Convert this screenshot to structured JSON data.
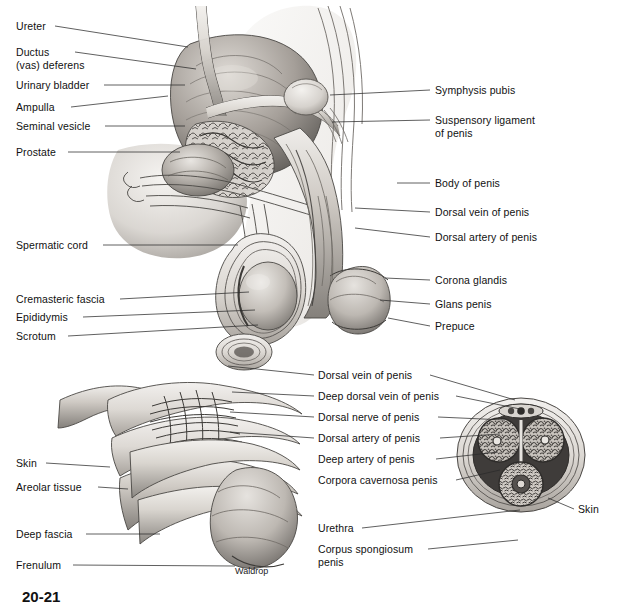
{
  "figure": {
    "artist_signature": "Waldrop",
    "figure_number": "20-21",
    "style": "grayscale airbrush medical illustration",
    "background_color": "#ffffff",
    "line_color": "#111111"
  },
  "upper_panel": {
    "name": "sagittal-section-male-pelvis",
    "left_labels": [
      {
        "id": "ureter",
        "text": "Ureter",
        "x": 16,
        "y": 20,
        "leader": [
          [
            55,
            26
          ],
          [
            188,
            47
          ]
        ]
      },
      {
        "id": "ductus-vas-deferens",
        "text": "Ductus\n(vas) deferens",
        "x": 16,
        "y": 46,
        "leader": [
          [
            75,
            52
          ],
          [
            196,
            69
          ]
        ]
      },
      {
        "id": "urinary-bladder",
        "text": "Urinary bladder",
        "x": 16,
        "y": 79,
        "leader": [
          [
            104,
            85
          ],
          [
            185,
            85
          ]
        ]
      },
      {
        "id": "ampulla",
        "text": "Ampulla",
        "x": 16,
        "y": 101,
        "leader": [
          [
            71,
            107
          ],
          [
            168,
            96
          ]
        ]
      },
      {
        "id": "seminal-vesicle",
        "text": "Seminal vesicle",
        "x": 16,
        "y": 120,
        "leader": [
          [
            105,
            126
          ],
          [
            185,
            126
          ]
        ]
      },
      {
        "id": "prostate",
        "text": "Prostate",
        "x": 16,
        "y": 146,
        "leader": [
          [
            68,
            152
          ],
          [
            180,
            152
          ]
        ]
      },
      {
        "id": "spermatic-cord",
        "text": "Spermatic cord",
        "x": 16,
        "y": 239,
        "leader": [
          [
            103,
            245
          ],
          [
            238,
            245
          ]
        ]
      },
      {
        "id": "cremasteric-fascia",
        "text": "Cremasteric fascia",
        "x": 16,
        "y": 293,
        "leader": [
          [
            120,
            299
          ],
          [
            249,
            292
          ]
        ]
      },
      {
        "id": "epididymis",
        "text": "Epididymis",
        "x": 16,
        "y": 311,
        "leader": [
          [
            83,
            317
          ],
          [
            255,
            310
          ]
        ]
      },
      {
        "id": "scrotum",
        "text": "Scrotum",
        "x": 16,
        "y": 330,
        "leader": [
          [
            68,
            336
          ],
          [
            258,
            325
          ]
        ]
      }
    ],
    "right_labels": [
      {
        "id": "symphysis-pubis",
        "text": "Symphysis pubis",
        "x": 435,
        "y": 84,
        "leader": [
          [
            430,
            90
          ],
          [
            330,
            95
          ]
        ]
      },
      {
        "id": "suspensory-ligament-of-penis",
        "text": "Suspensory ligament\nof penis",
        "x": 435,
        "y": 114,
        "leader": [
          [
            430,
            120
          ],
          [
            332,
            122
          ]
        ]
      },
      {
        "id": "body-of-penis",
        "text": "Body of penis",
        "x": 435,
        "y": 177,
        "leader": [
          [
            430,
            183
          ],
          [
            397,
            183
          ]
        ]
      },
      {
        "id": "dorsal-vein-of-penis",
        "text": "Dorsal vein of penis",
        "x": 435,
        "y": 206,
        "leader": [
          [
            430,
            212
          ],
          [
            355,
            208
          ]
        ]
      },
      {
        "id": "dorsal-artery-of-penis",
        "text": "Dorsal artery of penis",
        "x": 435,
        "y": 231,
        "leader": [
          [
            430,
            237
          ],
          [
            355,
            228
          ]
        ]
      },
      {
        "id": "corona-glandis",
        "text": "Corona glandis",
        "x": 435,
        "y": 274,
        "leader": [
          [
            430,
            280
          ],
          [
            385,
            278
          ]
        ]
      },
      {
        "id": "glans-penis",
        "text": "Glans penis",
        "x": 435,
        "y": 298,
        "leader": [
          [
            430,
            304
          ],
          [
            380,
            300
          ]
        ]
      },
      {
        "id": "prepuce",
        "text": "Prepuce",
        "x": 435,
        "y": 320,
        "leader": [
          [
            430,
            326
          ],
          [
            388,
            318
          ]
        ]
      }
    ]
  },
  "lower_left_panel": {
    "name": "penis-dissection-superficial-layers",
    "labels": [
      {
        "id": "skin",
        "text": "Skin",
        "x": 16,
        "y": 457,
        "leader": [
          [
            46,
            463
          ],
          [
            110,
            467
          ]
        ]
      },
      {
        "id": "areolar-tissue",
        "text": "Areolar tissue",
        "x": 16,
        "y": 481,
        "leader": [
          [
            98,
            487
          ],
          [
            128,
            489
          ]
        ]
      },
      {
        "id": "deep-fascia",
        "text": "Deep fascia",
        "x": 16,
        "y": 528,
        "leader": [
          [
            86,
            534
          ],
          [
            160,
            534
          ]
        ]
      },
      {
        "id": "frenulum",
        "text": "Frenulum",
        "x": 16,
        "y": 559,
        "leader": [
          [
            73,
            565
          ],
          [
            235,
            566
          ]
        ]
      }
    ]
  },
  "center_labels": {
    "name": "shared-structure-labels",
    "items": [
      {
        "id": "dorsal-vein-of-penis-2",
        "text": "Dorsal vein of penis",
        "x": 318,
        "y": 369,
        "leader_left": [
          [
            314,
            375
          ],
          [
            228,
            366
          ]
        ],
        "leader_right": [
          [
            430,
            375
          ],
          [
            515,
            400
          ]
        ]
      },
      {
        "id": "deep-dorsal-vein-of-penis",
        "text": "Deep dorsal vein of penis",
        "x": 318,
        "y": 390,
        "leader_left": [
          [
            314,
            396
          ],
          [
            232,
            392
          ]
        ],
        "leader_right": [
          [
            456,
            396
          ],
          [
            520,
            409
          ]
        ]
      },
      {
        "id": "dorsal-nerve-of-penis",
        "text": "Dorsal nerve of penis",
        "x": 318,
        "y": 411,
        "leader_left": [
          [
            314,
            417
          ],
          [
            230,
            412
          ]
        ],
        "leader_right": [
          [
            438,
            417
          ],
          [
            505,
            420
          ]
        ]
      },
      {
        "id": "dorsal-artery-of-penis-2",
        "text": "Dorsal artery of penis",
        "x": 318,
        "y": 432,
        "leader_left": [
          [
            314,
            438
          ],
          [
            230,
            432
          ]
        ],
        "leader_right": [
          [
            440,
            438
          ],
          [
            500,
            434
          ]
        ]
      },
      {
        "id": "deep-artery-of-penis",
        "text": "Deep artery of penis",
        "x": 318,
        "y": 453,
        "leader_right": [
          [
            436,
            459
          ],
          [
            498,
            452
          ]
        ]
      },
      {
        "id": "corpora-cavernosa-penis",
        "text": "Corpora cavernosa penis",
        "x": 318,
        "y": 474,
        "leader_right": [
          [
            456,
            480
          ],
          [
            500,
            470
          ]
        ]
      },
      {
        "id": "urethra",
        "text": "Urethra",
        "x": 318,
        "y": 522,
        "leader_right": [
          [
            362,
            528
          ],
          [
            520,
            510
          ]
        ]
      },
      {
        "id": "corpus-spongiosum-penis",
        "text": "Corpus spongiosum\npenis",
        "x": 318,
        "y": 543,
        "leader_right": [
          [
            428,
            549
          ],
          [
            518,
            540
          ]
        ]
      }
    ]
  },
  "cross_section_panel": {
    "name": "penis-cross-section",
    "right_label": {
      "id": "skin-cross-section",
      "text": "Skin",
      "x": 578,
      "y": 503,
      "leader": [
        [
          574,
          509
        ],
        [
          548,
          498
        ]
      ]
    },
    "structures": [
      "corpus cavernosum penis (left)",
      "corpus cavernosum penis (right)",
      "corpus spongiosum penis",
      "urethra",
      "deep artery of penis",
      "dorsal vein, artery and nerve bundle",
      "tunica albuginea",
      "deep fascia",
      "areolar tissue",
      "skin"
    ]
  }
}
